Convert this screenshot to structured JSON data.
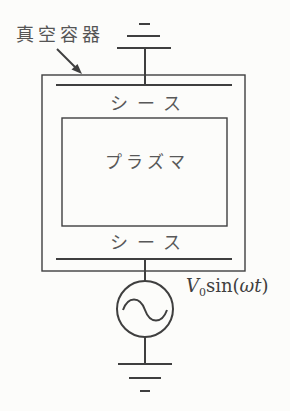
{
  "figure": {
    "colors": {
      "background": "#fcfcfa",
      "line": "#3f3f3f",
      "text": "#555555"
    },
    "labels": {
      "vacuum_vessel": "真空容器",
      "sheath_top": "シース",
      "plasma": "プラズマ",
      "sheath_bottom": "シース",
      "voltage_source_full": "V0 sin(ωt)",
      "voltage_v": "V",
      "voltage_sub": "0",
      "voltage_fn": "sin(",
      "voltage_arg": "ωt",
      "voltage_close": ")"
    }
  }
}
